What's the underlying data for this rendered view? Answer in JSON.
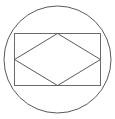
{
  "figure": {
    "background_color": "#ffffff",
    "canvas": {
      "width": 115,
      "height": 119
    },
    "stroke_color": "#5a5a5a",
    "stroke_color_secondary": "#6b6b6b",
    "stroke_width": 1,
    "fill": "none",
    "shapes": {
      "circle": {
        "name": "circumscribed-circle",
        "cx": 57.5,
        "cy": 59.5,
        "r": 53.5,
        "stroke": "#5a5a5a",
        "stroke_width": 1
      },
      "rectangle": {
        "name": "inscribed-rectangle",
        "x": 14.5,
        "y": 33.5,
        "width": 86,
        "height": 52,
        "stroke": "#6b6b6b",
        "stroke_width": 1
      },
      "rhombus": {
        "name": "inscribed-rhombus",
        "points": "57.5,33.5 100.5,59.5 57.5,85.5 14.5,59.5",
        "vertices": [
          {
            "label": "top",
            "x": 57.5,
            "y": 33.5
          },
          {
            "label": "right",
            "x": 100.5,
            "y": 59.5
          },
          {
            "label": "bottom",
            "x": 57.5,
            "y": 85.5
          },
          {
            "label": "left",
            "x": 14.5,
            "y": 59.5
          }
        ],
        "stroke": "#5a5a5a",
        "stroke_width": 1
      }
    }
  }
}
